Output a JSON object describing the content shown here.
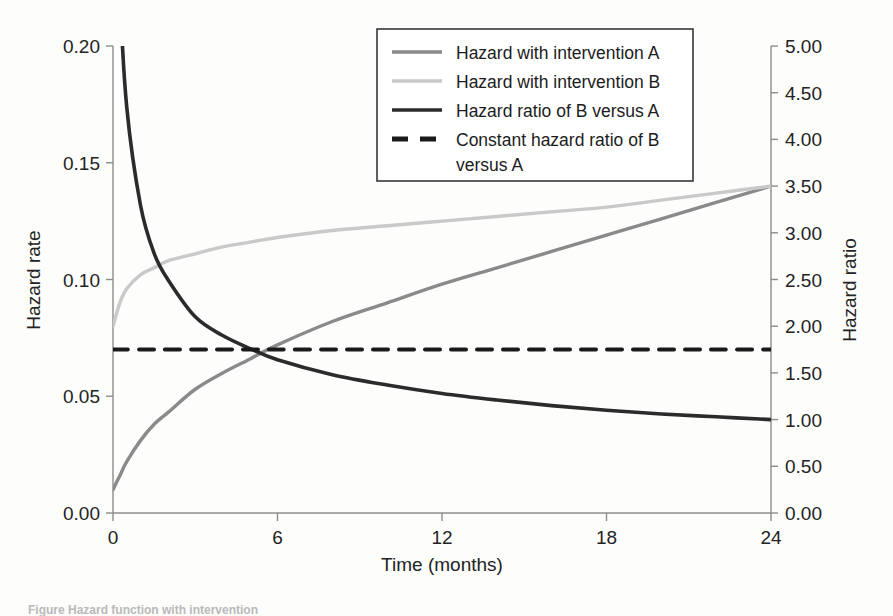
{
  "figure": {
    "background_color": "#fdfdfc",
    "caption_fragment": "Figure  Hazard function with intervention"
  },
  "chart_data": {
    "type": "line",
    "title": "",
    "xlabel": "Time (months)",
    "ylabel": "Hazard rate",
    "y2label": "Hazard ratio",
    "xlim": [
      0,
      24
    ],
    "ylim": [
      0.0,
      0.2
    ],
    "y2lim": [
      0.0,
      5.0
    ],
    "xticks": [
      "0",
      "6",
      "12",
      "18",
      "24"
    ],
    "xtick_values": [
      0,
      6,
      12,
      18,
      24
    ],
    "yticks": [
      "0.00",
      "0.05",
      "0.10",
      "0.15",
      "0.20"
    ],
    "ytick_values": [
      0.0,
      0.05,
      0.1,
      0.15,
      0.2
    ],
    "y2ticks": [
      "0.00",
      "0.50",
      "1.00",
      "1.50",
      "2.00",
      "2.50",
      "3.00",
      "3.50",
      "4.00",
      "4.50",
      "5.00"
    ],
    "y2tick_values": [
      0.0,
      0.5,
      1.0,
      1.5,
      2.0,
      2.5,
      3.0,
      3.5,
      4.0,
      4.5,
      5.0
    ],
    "grid": false,
    "legend_position": "top-right",
    "x": [
      0,
      0.25,
      0.5,
      1,
      1.5,
      2,
      3,
      4,
      5,
      6,
      8,
      10,
      12,
      14,
      16,
      18,
      20,
      22,
      24
    ],
    "series": [
      {
        "name": "Hazard with intervention A",
        "axis": "left",
        "color": "#8a8a8a",
        "style": "solid",
        "width": 3.4,
        "values": [
          0.01,
          0.016,
          0.022,
          0.031,
          0.038,
          0.043,
          0.053,
          0.06,
          0.066,
          0.072,
          0.082,
          0.09,
          0.098,
          0.105,
          0.112,
          0.119,
          0.126,
          0.133,
          0.14
        ]
      },
      {
        "name": "Hazard with intervention B",
        "axis": "left",
        "color": "#c9c9c9",
        "style": "solid",
        "width": 3.4,
        "values": [
          0.08,
          0.09,
          0.096,
          0.102,
          0.105,
          0.108,
          0.111,
          0.114,
          0.116,
          0.118,
          0.121,
          0.123,
          0.125,
          0.127,
          0.129,
          0.131,
          0.134,
          0.137,
          0.14
        ]
      },
      {
        "name": "Hazard ratio of B versus A",
        "axis": "right",
        "color": "#2b2b2b",
        "style": "solid",
        "width": 3.6,
        "values": [
          8.0,
          5.6,
          4.35,
          3.3,
          2.78,
          2.5,
          2.1,
          1.9,
          1.76,
          1.64,
          1.48,
          1.37,
          1.28,
          1.21,
          1.15,
          1.1,
          1.06,
          1.03,
          1.0
        ]
      },
      {
        "name": "Constant hazard ratio of B versus A",
        "axis": "right",
        "color": "#1a1a1a",
        "style": "dashed",
        "width": 4.0,
        "constant": 1.75,
        "values": [
          1.75,
          1.75,
          1.75,
          1.75,
          1.75,
          1.75,
          1.75,
          1.75,
          1.75,
          1.75,
          1.75,
          1.75,
          1.75,
          1.75,
          1.75,
          1.75,
          1.75,
          1.75,
          1.75
        ]
      }
    ],
    "annotations": {
      "crossing_point_months": 5.6,
      "crossing_hazard_ratio": 1.75
    }
  },
  "legend": {
    "items": [
      {
        "label": "Hazard with intervention A",
        "color": "#8a8a8a",
        "style": "solid"
      },
      {
        "label": "Hazard with intervention B",
        "color": "#c9c9c9",
        "style": "solid"
      },
      {
        "label": "Hazard ratio of B versus A",
        "color": "#2b2b2b",
        "style": "solid"
      },
      {
        "label": "Constant hazard ratio of B",
        "label2": "versus A",
        "color": "#1a1a1a",
        "style": "dashed"
      }
    ]
  }
}
